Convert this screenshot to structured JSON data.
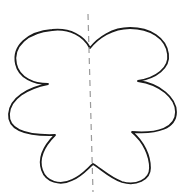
{
  "figure": {
    "colors": {
      "background": "#ffffff",
      "outline": "#1a1a1a",
      "axis": "#9a9a9a"
    },
    "shape": {
      "lobes": 6,
      "outline_path": "M90,48 C84,36 70,28 52,30 C28,32 12,46 16,64 C19,78 34,84 48,84 C28,88 10,98 9,114 C8,128 22,136 55,135 C44,146 38,158 42,170 C46,182 60,186 72,180 C82,176 88,168 93,164 C100,168 110,178 122,182 C136,186 150,180 150,168 C150,156 144,142 132,132 C158,134 176,128 176,112 C176,98 160,84 138,81 C156,78 170,68 168,54 C166,38 150,28 130,28 C112,28 98,38 90,48 Z"
    },
    "axis_of_symmetry": {
      "style": "dashed",
      "x1": 88,
      "y1": 14,
      "x2": 93,
      "y2": 192
    }
  }
}
